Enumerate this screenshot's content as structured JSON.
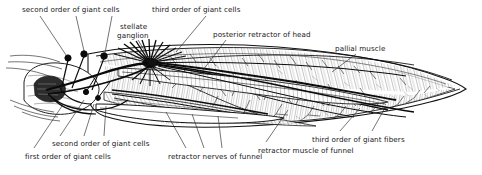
{
  "figure": {
    "kind": "anatomical-illustration",
    "background_color": "#ffffff",
    "ink_color": "#171717"
  },
  "labels": [
    {
      "id": "second-order-top",
      "text": "second order of giant cells",
      "x": 22,
      "y": 6,
      "align": "left"
    },
    {
      "id": "stellate-ganglion-1",
      "text": "stellate",
      "x": 120,
      "y": 23,
      "align": "left"
    },
    {
      "id": "stellate-ganglion-2",
      "text": "ganglion",
      "x": 117,
      "y": 32,
      "align": "left"
    },
    {
      "id": "third-order-cells",
      "text": "third order of giant cells",
      "x": 152,
      "y": 6,
      "align": "left"
    },
    {
      "id": "posterior-retractor",
      "text": "posterior retractor of head",
      "x": 213,
      "y": 31,
      "align": "left"
    },
    {
      "id": "pallial-muscle",
      "text": "pallial muscle",
      "x": 335,
      "y": 45,
      "align": "left"
    },
    {
      "id": "second-order-bottom",
      "text": "second order of giant cells",
      "x": 52,
      "y": 140,
      "align": "left"
    },
    {
      "id": "first-order-cells",
      "text": "first order of giant cells",
      "x": 25,
      "y": 153,
      "align": "left"
    },
    {
      "id": "retractor-nerves",
      "text": "retractor nerves of funnel",
      "x": 168,
      "y": 153,
      "align": "left"
    },
    {
      "id": "retractor-muscle",
      "text": "retractor muscle of funnel",
      "x": 258,
      "y": 147,
      "align": "left"
    },
    {
      "id": "third-order-fibers",
      "text": "third order of giant fibers",
      "x": 312,
      "y": 136,
      "align": "left"
    }
  ]
}
